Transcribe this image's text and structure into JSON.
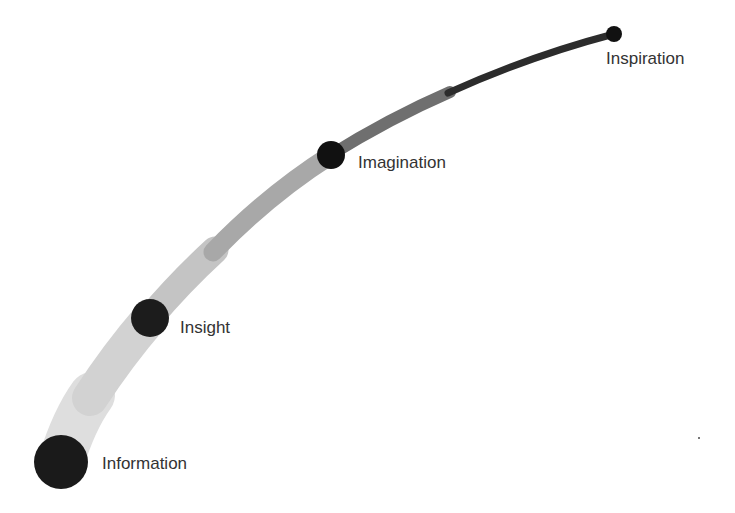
{
  "diagram": {
    "title": "",
    "stages": [
      {
        "label": "Information",
        "x": 61,
        "y": 462,
        "r": 27,
        "color": "#1a1a1a",
        "label_x": 102,
        "label_y": 454
      },
      {
        "label": "Insight",
        "x": 150,
        "y": 318,
        "r": 19,
        "color": "#1c1c1c",
        "label_x": 180,
        "label_y": 318
      },
      {
        "label": "Imagination",
        "x": 331,
        "y": 155,
        "r": 14,
        "color": "#111111",
        "label_x": 358,
        "label_y": 154
      },
      {
        "label": "Inspiration",
        "x": 614,
        "y": 34,
        "r": 8,
        "color": "#111111",
        "label_x": 606,
        "label_y": 49
      }
    ],
    "curve": {
      "start_color": "#d9d9d9",
      "end_color": "#1a1a1a",
      "start_width": 48,
      "end_width": 5
    }
  }
}
